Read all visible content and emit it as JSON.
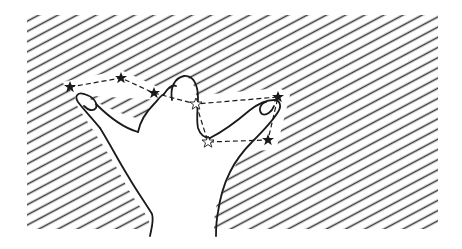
{
  "illustration": {
    "subject": "hand-gesture-with-constellation",
    "description": "Line drawing of a hand making a 'Y' / shaka gesture with thumb and pinky extended, overlaid with a dashed constellation of stars on a diagonal-hatched background",
    "colors": {
      "background": "#ffffff",
      "ink": "#1a1a1a",
      "hatch": "#3a3a3a"
    },
    "hatch_area": {
      "x": 27,
      "y": 15,
      "width": 411,
      "height": 214
    },
    "stars": [
      {
        "x": 70,
        "y": 87,
        "style": "filled"
      },
      {
        "x": 121,
        "y": 78,
        "style": "filled"
      },
      {
        "x": 154,
        "y": 93,
        "style": "filled"
      },
      {
        "x": 196,
        "y": 104,
        "style": "outline"
      },
      {
        "x": 278,
        "y": 97,
        "style": "filled"
      },
      {
        "x": 268,
        "y": 140,
        "style": "filled"
      },
      {
        "x": 208,
        "y": 142,
        "style": "outline"
      }
    ]
  }
}
